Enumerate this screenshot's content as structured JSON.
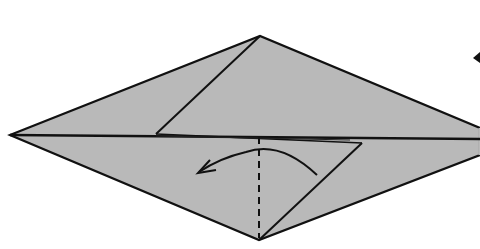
{
  "diagram": {
    "type": "origami-fold-step",
    "colors": {
      "background": "#ffffff",
      "paper": "#b9b9b9",
      "line": "#111111"
    },
    "elements": {
      "paper": "kite-shaped folded paper",
      "valley_fold": "vertical dashed fold line",
      "fold_arrow": "curved arrow pointing left",
      "offscreen_arrow_tip": "partial arrowhead at right edge"
    }
  }
}
